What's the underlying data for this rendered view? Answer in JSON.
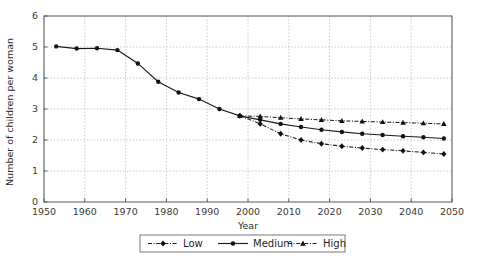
{
  "chart_data": {
    "type": "line",
    "title": "",
    "xlabel": "Year",
    "ylabel": "Number of children per woman",
    "xlim": [
      1950,
      2050
    ],
    "ylim": [
      0,
      6
    ],
    "grid": true,
    "legend_position": "bottom-center",
    "x_ticks": [
      1950,
      1960,
      1970,
      1980,
      1990,
      2000,
      2010,
      2020,
      2030,
      2040,
      2050
    ],
    "x_tick_labels": [
      "1950",
      "1960",
      "1970",
      "1980",
      "1990",
      "2000",
      "2010",
      "2020",
      "2030",
      "2040",
      "2050"
    ],
    "y_ticks": [
      0,
      1,
      2,
      3,
      4,
      5,
      6
    ],
    "y_tick_labels": [
      "0",
      "1",
      "2",
      "3",
      "4",
      "5",
      "6"
    ],
    "x": [
      1953,
      1958,
      1963,
      1968,
      1973,
      1978,
      1983,
      1988,
      1993,
      1998,
      2003,
      2008,
      2013,
      2018,
      2023,
      2028,
      2033,
      2038,
      2043,
      2048
    ],
    "series": [
      {
        "name": "Low",
        "marker": "diamond",
        "linestyle": "dash-dot",
        "x": [
          1998,
          2003,
          2008,
          2013,
          2018,
          2023,
          2028,
          2033,
          2038,
          2043,
          2048
        ],
        "values": [
          2.78,
          2.52,
          2.2,
          2.0,
          1.88,
          1.8,
          1.74,
          1.69,
          1.65,
          1.6,
          1.55
        ]
      },
      {
        "name": "Medium",
        "marker": "circle",
        "linestyle": "solid",
        "x": [
          1953,
          1958,
          1963,
          1968,
          1973,
          1978,
          1983,
          1988,
          1993,
          1998,
          2003,
          2008,
          2013,
          2018,
          2023,
          2028,
          2033,
          2038,
          2043,
          2048
        ],
        "values": [
          5.02,
          4.95,
          4.96,
          4.9,
          4.47,
          3.88,
          3.53,
          3.32,
          3.0,
          2.78,
          2.65,
          2.52,
          2.42,
          2.33,
          2.26,
          2.2,
          2.16,
          2.12,
          2.09,
          2.05
        ]
      },
      {
        "name": "High",
        "marker": "triangle",
        "linestyle": "dash-dot",
        "x": [
          1998,
          2003,
          2008,
          2013,
          2018,
          2023,
          2028,
          2033,
          2038,
          2043,
          2048
        ],
        "values": [
          2.78,
          2.76,
          2.72,
          2.68,
          2.65,
          2.62,
          2.6,
          2.58,
          2.56,
          2.54,
          2.52
        ]
      }
    ]
  },
  "legend": {
    "items": [
      {
        "label": "Low"
      },
      {
        "label": "Medium"
      },
      {
        "label": "High"
      }
    ]
  },
  "axes": {
    "x_title": "Year",
    "y_title": "Number of children per woman"
  }
}
